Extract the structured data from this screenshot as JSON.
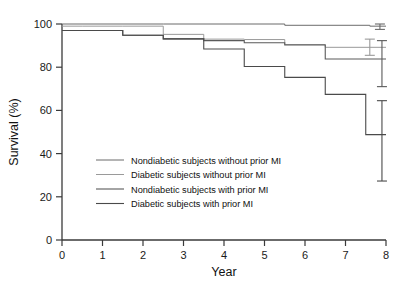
{
  "chart_data": {
    "type": "line",
    "subtype": "kaplan-meier-step",
    "title": "",
    "xlabel": "Year",
    "ylabel": "Survival (%)",
    "xlim": [
      0,
      8
    ],
    "ylim": [
      0,
      100
    ],
    "xticks": [
      0,
      1,
      2,
      3,
      4,
      5,
      6,
      7,
      8
    ],
    "xtick_labels": [
      "0",
      "1",
      "2",
      "3",
      "4",
      "5",
      "6",
      "7",
      "8"
    ],
    "yticks": [
      0,
      20,
      40,
      60,
      80,
      100
    ],
    "ytick_labels": [
      "0",
      "20",
      "40",
      "60",
      "80",
      "100"
    ],
    "grid": false,
    "legend_position": "lower-left-inside",
    "series": [
      {
        "name": "Nondiabetic subjects without prior MI",
        "color": "#6b6b6b",
        "line_width": 1.0,
        "steps_x": [
          0,
          2.5,
          5.5,
          7.6,
          8
        ],
        "steps_y": [
          100,
          100,
          99.4,
          99.0,
          99.0
        ],
        "error_bar": {
          "x": 7.85,
          "low": 97.5,
          "high": 100.0
        }
      },
      {
        "name": "Diabetic subjects without prior MI",
        "color": "#9a9a9a",
        "line_width": 1.0,
        "steps_x": [
          0,
          0.5,
          1.5,
          2.5,
          3.5,
          4.5,
          5.5,
          6.5,
          8
        ],
        "steps_y": [
          99,
          99,
          99,
          95.2,
          93,
          92.8,
          90.5,
          89.2,
          89.2
        ],
        "error_bar": {
          "x": 7.6,
          "low": 85.5,
          "high": 93.0
        }
      },
      {
        "name": "Nondiabetic subjects with prior MI",
        "color": "#5a5a5a",
        "line_width": 1.1,
        "steps_x": [
          0,
          0.5,
          1.5,
          2.5,
          3.5,
          4.5,
          5.5,
          6.5,
          8
        ],
        "steps_y": [
          97,
          97,
          94.8,
          93.1,
          92.3,
          91.3,
          90.3,
          83.8,
          83.8
        ],
        "error_bar": {
          "x": 7.9,
          "low": 71.0,
          "high": 92.3
        }
      },
      {
        "name": "Diabetic subjects with prior MI",
        "color": "#4a4a4a",
        "line_width": 1.1,
        "steps_x": [
          0,
          0.5,
          1.5,
          2.5,
          3.5,
          4.5,
          5.5,
          6.5,
          7.5,
          8
        ],
        "steps_y": [
          97,
          97,
          94.8,
          93.1,
          88.4,
          80.3,
          75.3,
          67.4,
          48.8,
          48.8
        ],
        "error_bar": {
          "x": 7.9,
          "low": 27.3,
          "high": 64.5
        }
      }
    ]
  },
  "legend": {
    "items": [
      "Nondiabetic subjects without prior MI",
      "Diabetic subjects without prior MI",
      "Nondiabetic subjects with prior MI",
      "Diabetic subjects with prior MI"
    ]
  },
  "colors": {
    "axis": "#3a3a3a",
    "text": "#111111",
    "background": "#ffffff"
  }
}
